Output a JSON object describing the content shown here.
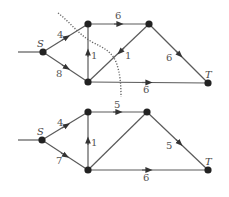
{
  "graphs": [
    {
      "name": "top-network",
      "nodes": {
        "S": {
          "label": "S",
          "x": 43,
          "y": 52
        },
        "A": {
          "label": "",
          "x": 88,
          "y": 24
        },
        "B": {
          "label": "",
          "x": 149,
          "y": 24
        },
        "C": {
          "label": "",
          "x": 88,
          "y": 82
        },
        "T": {
          "label": "T",
          "x": 208,
          "y": 83
        }
      },
      "edges": [
        {
          "from": "S",
          "to": "A",
          "label": "4"
        },
        {
          "from": "S",
          "to": "C",
          "label": "8"
        },
        {
          "from": "A",
          "to": "B",
          "label": "6"
        },
        {
          "from": "C",
          "to": "A",
          "label": "1"
        },
        {
          "from": "B",
          "to": "C",
          "label": "1"
        },
        {
          "from": "B",
          "to": "T",
          "label": "6"
        },
        {
          "from": "C",
          "to": "T",
          "label": "6"
        }
      ],
      "cut_line": "dotted"
    },
    {
      "name": "bottom-network",
      "nodes": {
        "S": {
          "label": "S",
          "x": 42,
          "y": 140
        },
        "A": {
          "label": "",
          "x": 88,
          "y": 112
        },
        "B": {
          "label": "",
          "x": 147,
          "y": 112
        },
        "C": {
          "label": "",
          "x": 88,
          "y": 170
        },
        "T": {
          "label": "T",
          "x": 208,
          "y": 170
        }
      },
      "edges": [
        {
          "from": "S",
          "to": "A",
          "label": "4"
        },
        {
          "from": "S",
          "to": "C",
          "label": "7"
        },
        {
          "from": "A",
          "to": "B",
          "label": "5"
        },
        {
          "from": "C",
          "to": "A",
          "label": "1"
        },
        {
          "from": "C",
          "to": "B",
          "label": ""
        },
        {
          "from": "B",
          "to": "T",
          "label": "5"
        },
        {
          "from": "C",
          "to": "T",
          "label": "6"
        }
      ]
    }
  ],
  "labels": {
    "top": {
      "S": "S",
      "T": "T",
      "sa": "4",
      "sc": "8",
      "ab": "6",
      "ca": "1",
      "bc": "1",
      "bt": "6",
      "ct": "6"
    },
    "bottom": {
      "S": "S",
      "T": "T",
      "sa": "4",
      "sc": "7",
      "ab": "5",
      "ca": "1",
      "bt": "5",
      "ct": "6"
    }
  }
}
